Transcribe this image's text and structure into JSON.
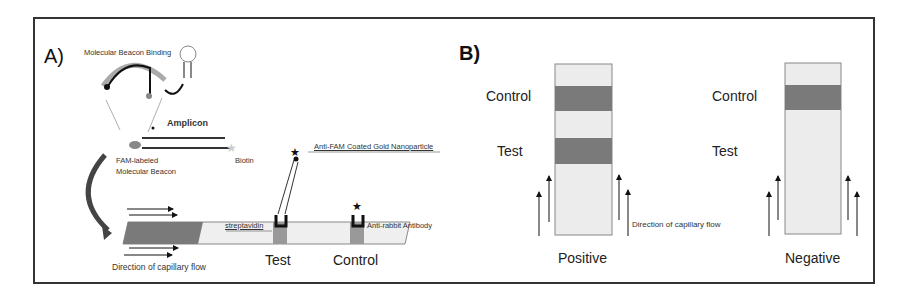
{
  "panel_a": {
    "label": "A)",
    "beacon_binding": "Molecular Beacon Binding",
    "amplicon": "Amplicon",
    "fam_beacon_line1": "FAM-labeled",
    "fam_beacon_line2": "Molecular Beacon",
    "biotin": "Biotin",
    "gold_np": "Anti-FAM Coated Gold Nanoparticle",
    "streptavidin": "streptavidin",
    "anti_rabbit": "Anti-rabbit Antibody",
    "flow": "Direction of capillary flow",
    "test": "Test",
    "control": "Control"
  },
  "panel_b": {
    "label": "B)",
    "positive": {
      "control": "Control",
      "test": "Test",
      "caption": "Positive"
    },
    "negative": {
      "control": "Control",
      "test": "Test",
      "caption": "Negative"
    },
    "flow": "Direction of  capillary flow"
  },
  "colors": {
    "band": "#7a7a7a",
    "strip": "#ececec",
    "pad": "#6b6b6b",
    "beacon_arc": "#aaaaaa"
  }
}
